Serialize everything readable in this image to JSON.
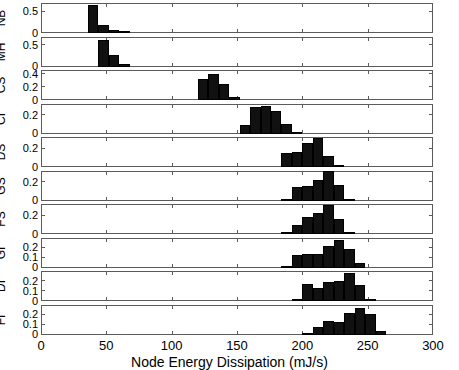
{
  "chart_data": {
    "type": "bar",
    "title": "",
    "xlabel": "Node Energy Dissipation (mJ/s)",
    "ylabel": "",
    "xlim": [
      0,
      300
    ],
    "xticks": [
      0,
      50,
      100,
      150,
      200,
      250,
      300
    ],
    "xticklabels": [
      "0",
      "50",
      "100",
      "150",
      "200",
      "250",
      "300"
    ],
    "grid": false,
    "legend": null,
    "layout": "10 stacked histogram subplots sharing one x-axis",
    "bin_width": 8,
    "subplots": [
      {
        "label": "NB",
        "ylim": [
          0,
          0.7
        ],
        "yticks": [
          0,
          0.5
        ],
        "yticklabels": [
          "0",
          "0.5"
        ],
        "bins": [
          36,
          44,
          52,
          60,
          68
        ],
        "values": [
          0.66,
          0.19,
          0.07,
          0.01,
          0.0
        ]
      },
      {
        "label": "MH",
        "ylim": [
          0,
          0.7
        ],
        "yticks": [
          0,
          0.5
        ],
        "yticklabels": [
          "0",
          "0.5"
        ],
        "bins": [
          44,
          52,
          60,
          68
        ],
        "values": [
          0.63,
          0.27,
          0.05,
          0.0
        ]
      },
      {
        "label": "CS",
        "ylim": [
          0,
          0.47
        ],
        "yticks": [
          0,
          0.2,
          0.4
        ],
        "yticklabels": [
          "0",
          "0.2",
          "0.4"
        ],
        "bins": [
          120,
          128,
          136,
          144,
          152
        ],
        "values": [
          0.33,
          0.41,
          0.25,
          0.04,
          0.0
        ]
      },
      {
        "label": "CI",
        "ylim": [
          0,
          0.33
        ],
        "yticks": [
          0,
          0.2
        ],
        "yticklabels": [
          "0",
          "0.2"
        ],
        "bins": [
          152,
          160,
          168,
          176,
          184,
          192,
          200
        ],
        "values": [
          0.09,
          0.29,
          0.3,
          0.25,
          0.1,
          0.02,
          0.0
        ]
      },
      {
        "label": "DS",
        "ylim": [
          0,
          0.33
        ],
        "yticks": [
          0,
          0.2
        ],
        "yticklabels": [
          "0",
          "0.2"
        ],
        "bins": [
          184,
          192,
          200,
          208,
          216,
          224,
          232
        ],
        "values": [
          0.15,
          0.17,
          0.26,
          0.32,
          0.12,
          0.02,
          0.0
        ]
      },
      {
        "label": "GS",
        "ylim": [
          0,
          0.33
        ],
        "yticks": [
          0,
          0.2
        ],
        "yticklabels": [
          "0",
          "0.2"
        ],
        "bins": [
          184,
          192,
          200,
          208,
          216,
          224,
          232
        ],
        "values": [
          0.02,
          0.15,
          0.16,
          0.23,
          0.33,
          0.17,
          0.02
        ]
      },
      {
        "label": "FS",
        "ylim": [
          0,
          0.33
        ],
        "yticks": [
          0,
          0.2
        ],
        "yticklabels": [
          "0",
          "0.2"
        ],
        "bins": [
          184,
          192,
          200,
          208,
          216,
          224,
          232
        ],
        "values": [
          0.02,
          0.1,
          0.19,
          0.23,
          0.32,
          0.16,
          0.02
        ]
      },
      {
        "label": "GI",
        "ylim": [
          0,
          0.3
        ],
        "yticks": [
          0,
          0.1,
          0.2
        ],
        "yticklabels": [
          "0",
          "0.1",
          "0.2"
        ],
        "bins": [
          184,
          192,
          200,
          208,
          216,
          224,
          232,
          240,
          248
        ],
        "values": [
          0.02,
          0.13,
          0.14,
          0.14,
          0.22,
          0.28,
          0.19,
          0.05,
          0.0
        ]
      },
      {
        "label": "DI",
        "ylim": [
          0,
          0.3
        ],
        "yticks": [
          0,
          0.1,
          0.2
        ],
        "yticklabels": [
          "0",
          "0.1",
          "0.2"
        ],
        "bins": [
          192,
          200,
          208,
          216,
          224,
          232,
          240,
          248,
          256
        ],
        "values": [
          0.02,
          0.17,
          0.13,
          0.19,
          0.2,
          0.28,
          0.16,
          0.02,
          0.0
        ]
      },
      {
        "label": "FI",
        "ylim": [
          0,
          0.3
        ],
        "yticks": [
          0,
          0.1,
          0.2
        ],
        "yticklabels": [
          "0",
          "0.1",
          "0.2"
        ],
        "bins": [
          200,
          208,
          216,
          224,
          232,
          240,
          248,
          256,
          264
        ],
        "values": [
          0.01,
          0.08,
          0.14,
          0.13,
          0.22,
          0.27,
          0.21,
          0.04,
          0.0
        ]
      }
    ]
  },
  "axis": {
    "x_title": "Node Energy Dissipation (mJ/s)"
  },
  "colors": {
    "bar": "#111111",
    "axis": "#5b5b5b",
    "background": "#ffffff"
  }
}
